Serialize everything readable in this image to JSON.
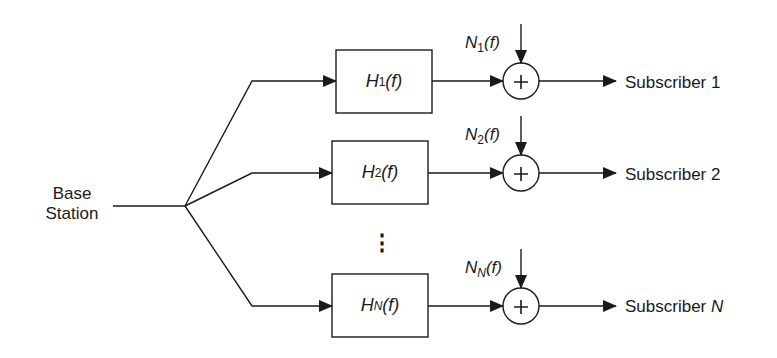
{
  "diagram": {
    "type": "block-diagram",
    "source": {
      "label_line1": "Base",
      "label_line2": "Station"
    },
    "branches": [
      {
        "id": "1",
        "filter": {
          "prefix": "H",
          "subscript": "1",
          "suffix": "(f)"
        },
        "noise": {
          "prefix": "N",
          "subscript": "1",
          "suffix": "(f)"
        },
        "summer_symbol": "+",
        "subscriber": {
          "text": "Subscriber ",
          "index": "1",
          "index_italic": false
        }
      },
      {
        "id": "2",
        "filter": {
          "prefix": "H",
          "subscript": "2",
          "suffix": "(f)"
        },
        "noise": {
          "prefix": "N",
          "subscript": "2",
          "suffix": "(f)"
        },
        "summer_symbol": "+",
        "subscriber": {
          "text": "Subscriber ",
          "index": "2",
          "index_italic": false
        }
      },
      {
        "id": "N",
        "filter": {
          "prefix": "H",
          "subscript": "N",
          "suffix": "(f)"
        },
        "noise": {
          "prefix": "N",
          "subscript": "N",
          "suffix": "(f)"
        },
        "summer_symbol": "+",
        "subscriber": {
          "text": "Subscriber ",
          "index": "N",
          "index_italic": true
        }
      }
    ],
    "ellipsis": "⋮",
    "colors": {
      "stroke": "#1a1a1a",
      "background": "#ffffff"
    }
  }
}
